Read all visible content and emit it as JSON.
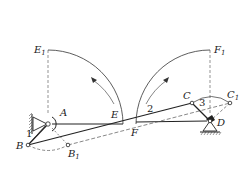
{
  "diagram": {
    "type": "linkage-mechanism",
    "colors": {
      "line": "#333333",
      "dashed": "#555555",
      "background": "#ffffff"
    },
    "points": {
      "A": {
        "label": "A",
        "x": 48,
        "y": 124
      },
      "B": {
        "label": "B",
        "x": 28,
        "y": 145
      },
      "B1": {
        "label": "B",
        "sub": "1",
        "x": 68,
        "y": 145
      },
      "C": {
        "label": "C",
        "x": 192,
        "y": 103
      },
      "C1": {
        "label": "C",
        "sub": "1",
        "x": 230,
        "y": 103
      },
      "D": {
        "label": "D",
        "x": 210,
        "y": 121
      },
      "E": {
        "label": "E",
        "x": 123,
        "y": 124
      },
      "E1": {
        "label": "E",
        "sub": "1",
        "x": 48,
        "y": 50
      },
      "F": {
        "label": "F",
        "x": 136,
        "y": 122
      },
      "F1": {
        "label": "F",
        "sub": "1",
        "x": 210,
        "y": 50
      }
    },
    "links": [
      {
        "id": "1",
        "label": "1"
      },
      {
        "id": "2",
        "label": "2"
      },
      {
        "id": "3",
        "label": "3"
      }
    ]
  }
}
